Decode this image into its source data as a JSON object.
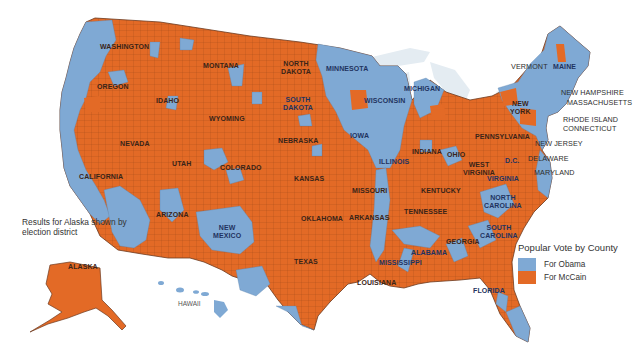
{
  "title": "Popular Vote by County",
  "colors": {
    "obama": "#7fa9d4",
    "mccain": "#e36a26",
    "water": "#e4ecf2",
    "border": "#6b3a20"
  },
  "legend": {
    "title": "Popular Vote by County",
    "items": [
      {
        "label": "For Obama",
        "color": "#7fa9d4"
      },
      {
        "label": "For McCain",
        "color": "#e36a26"
      }
    ]
  },
  "alaska_note": "Results for Alaska shown by election district",
  "labels": {
    "washington": "WASHINGTON",
    "oregon": "OREGON",
    "california": "CALIFORNIA",
    "nevada": "NEVADA",
    "idaho": "IDAHO",
    "montana": "MONTANA",
    "wyoming": "WYOMING",
    "utah": "UTAH",
    "arizona": "ARIZONA",
    "colorado": "COLORADO",
    "new_mexico": "NEW\nMEXICO",
    "north_dakota": "NORTH\nDAKOTA",
    "south_dakota": "SOUTH\nDAKOTA",
    "nebraska": "NEBRASKA",
    "kansas": "KANSAS",
    "oklahoma": "OKLAHOMA",
    "texas": "TEXAS",
    "minnesota": "MINNESOTA",
    "iowa": "IOWA",
    "missouri": "MISSOURI",
    "arkansas": "ARKANSAS",
    "louisiana": "LOUISIANA",
    "wisconsin": "WISCONSIN",
    "illinois": "ILLINOIS",
    "michigan": "MICHIGAN",
    "indiana": "INDIANA",
    "ohio": "OHIO",
    "kentucky": "KENTUCKY",
    "tennessee": "TENNESSEE",
    "mississippi": "MISSISSIPPI",
    "alabama": "ALABAMA",
    "georgia": "GEORGIA",
    "florida": "FLORIDA",
    "south_carolina": "SOUTH\nCAROLINA",
    "north_carolina": "NORTH\nCAROLINA",
    "virginia": "VIRGINIA",
    "west_virginia": "WEST\nVIRGINIA",
    "pennsylvania": "PENNSYLVANIA",
    "new_york": "NEW\nYORK",
    "dc": "D.C.",
    "maine": "MAINE",
    "vermont": "VERMONT",
    "new_hampshire": "NEW HAMPSHIRE",
    "massachusetts": "MASSACHUSETTS",
    "rhode_island": "RHODE ISLAND",
    "connecticut": "CONNECTICUT",
    "new_jersey": "NEW JERSEY",
    "delaware": "DELAWARE",
    "maryland": "MARYLAND",
    "alaska": "ALASKA",
    "hawaii": "HAWAII"
  }
}
